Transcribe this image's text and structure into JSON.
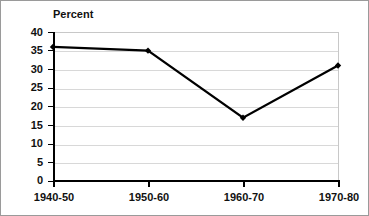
{
  "chart_data": {
    "type": "line",
    "title": "Percent",
    "xlabel": "",
    "ylabel": "",
    "categories": [
      "1940-50",
      "1950-60",
      "1960-70",
      "1970-80"
    ],
    "values": [
      36,
      35,
      17,
      31
    ],
    "series": [
      {
        "name": "Percent",
        "values": [
          36,
          35,
          17,
          31
        ]
      }
    ],
    "ylim": [
      0,
      40
    ],
    "yticks": [
      0,
      5,
      10,
      15,
      20,
      25,
      30,
      35,
      40
    ],
    "ytick_labels": [
      "0",
      "5",
      "10",
      "15",
      "20",
      "25",
      "30",
      "35",
      "40"
    ],
    "grid": true,
    "grid_axis": "y",
    "legend": false,
    "legend_position": "none",
    "marker": "diamond",
    "line_color": "#000000",
    "marker_color": "#000000",
    "grid_color": "#d8d8d8",
    "axis_color": "#000000",
    "background_color": "#ffffff",
    "border_color": "#9a9a9a"
  }
}
